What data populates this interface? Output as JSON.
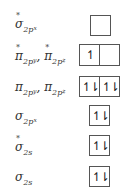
{
  "orbitals": [
    {
      "symbol": "σ",
      "sub": "2p",
      "subsub": "x",
      "star": true,
      "label_text": "σ*2px",
      "electrons": [
        ""
      ]
    },
    {
      "symbol": "π",
      "sub": "2p",
      "subsub": "y",
      "star": true,
      "symbol2": "π",
      "sub_b": "2p",
      "subsub_b": "z",
      "label_text": "π*2py, π*2pz",
      "electrons": [
        "↿",
        ""
      ]
    },
    {
      "symbol": "π",
      "sub": "2p",
      "subsub": "y",
      "star": false,
      "symbol2": "π",
      "sub_b": "2p",
      "subsub_b": "z",
      "label_text": "π2py, π2pz",
      "electrons": [
        "↿⇂",
        "↿⇂"
      ]
    },
    {
      "symbol": "σ",
      "sub": "2p",
      "subsub": "x",
      "star": false,
      "label_text": "σ2px",
      "electrons": [
        "↿⇂"
      ]
    },
    {
      "symbol": "σ",
      "sub": "2s",
      "star": true,
      "label_text": "σ*2s",
      "electrons": [
        "↿⇂"
      ]
    },
    {
      "symbol": "σ",
      "sub": "2s",
      "star": false,
      "label_text": "σ2s",
      "electrons": [
        "↿⇂"
      ]
    }
  ],
  "separator": ","
}
